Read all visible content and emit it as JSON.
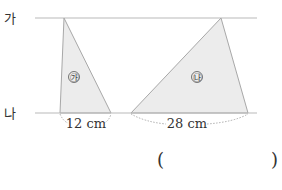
{
  "figure": {
    "lines": [
      {
        "label": "가",
        "y": 18
      },
      {
        "label": "나",
        "y": 113
      }
    ],
    "triangles": [
      {
        "label": "㉮",
        "base": "12 cm",
        "apex": [
          64,
          18
        ],
        "base_left": [
          60,
          113
        ],
        "base_right": [
          111,
          113
        ]
      },
      {
        "label": "㉯",
        "base": "28 cm",
        "apex": [
          221,
          18
        ],
        "base_left": [
          131,
          113
        ],
        "base_right": [
          248,
          113
        ]
      }
    ],
    "colors": {
      "line": "#b9b9b9",
      "fill": "#ececec",
      "triangle_stroke": "#a8a8a8",
      "text": "#333333"
    }
  },
  "answer": {
    "open_paren": "(",
    "close_paren": ")",
    "value": ""
  }
}
